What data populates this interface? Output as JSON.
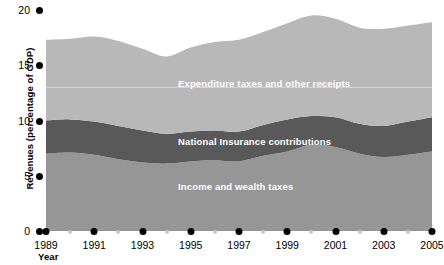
{
  "chart_data": {
    "type": "area",
    "title": "",
    "xlabel": "Year",
    "ylabel": "Revenues (percentage of GDP)",
    "stacked": true,
    "grid": false,
    "gridline_at": 13,
    "legend_position": "inline-band-labels",
    "xlim": [
      1989,
      2005
    ],
    "ylim": [
      0,
      20
    ],
    "yticks": [
      "0",
      "5",
      "10",
      "15",
      "20"
    ],
    "ytick_values": [
      0,
      5,
      10,
      15,
      20
    ],
    "xticks": [
      "1989",
      "1991",
      "1993",
      "1995",
      "1997",
      "1999",
      "2001",
      "2003",
      "2005"
    ],
    "xtick_values": [
      1989,
      1991,
      1993,
      1995,
      1997,
      1999,
      2001,
      2003,
      2005
    ],
    "xminor_values": [
      1990,
      1992,
      1994,
      1996,
      1998,
      2000,
      2002,
      2004
    ],
    "x": [
      1989,
      1990,
      1991,
      1992,
      1993,
      1994,
      1995,
      1996,
      1997,
      1998,
      1999,
      2000,
      2001,
      2002,
      2003,
      2004,
      2005
    ],
    "series": [
      {
        "name": "Income and wealth taxes",
        "color": "#969696",
        "values": [
          7.0,
          7.1,
          6.9,
          6.5,
          6.2,
          6.1,
          6.3,
          6.4,
          6.3,
          6.8,
          7.2,
          7.8,
          7.6,
          7.0,
          6.7,
          6.9,
          7.2
        ]
      },
      {
        "name": "National Insurance contributions",
        "color": "#595959",
        "values": [
          3.0,
          3.0,
          3.0,
          3.0,
          2.9,
          2.7,
          2.7,
          2.7,
          2.7,
          2.8,
          2.9,
          2.6,
          2.7,
          2.7,
          2.8,
          3.0,
          3.1
        ]
      },
      {
        "name": "Expenditure taxes and other receipts",
        "color": "#b8b8b8",
        "values": [
          7.3,
          7.3,
          7.7,
          7.7,
          7.4,
          7.0,
          7.6,
          8.0,
          8.3,
          8.4,
          8.7,
          9.1,
          8.9,
          8.7,
          8.8,
          8.7,
          8.6
        ]
      }
    ],
    "totals": [
      17.3,
      17.4,
      17.6,
      17.2,
      16.5,
      15.8,
      16.6,
      17.1,
      17.3,
      18.0,
      18.8,
      19.5,
      19.2,
      18.4,
      18.3,
      18.6,
      18.9
    ]
  },
  "colors": {
    "top_band": "#b8b8b8",
    "middle_band": "#595959",
    "bottom_band": "#969696",
    "gridline": "#d9d9d9",
    "axis_dot": "#000000",
    "minor_dot": "#c8c8c8",
    "band_label_text": "#ffffff"
  },
  "axes": {
    "y_title": "Revenues (percentage of GDP)",
    "x_title": "Year"
  },
  "band_labels": {
    "top": "Expenditure taxes and other receipts",
    "middle": "National Insurance contributions",
    "bottom": "Income and wealth taxes"
  }
}
